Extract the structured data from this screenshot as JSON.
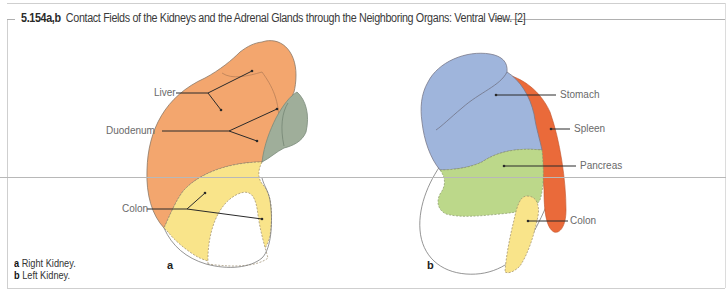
{
  "figure": {
    "number": "5.154a,b",
    "title": "Contact Fields of the Kidneys and the Adrenal Glands through the Neighboring Organs: Ventral View. [2]"
  },
  "panels": [
    {
      "letter": "a",
      "caption_letter": "a",
      "caption_text": "Right Kidney.",
      "labels": [
        "Liver",
        "Duodenum",
        "Colon"
      ]
    },
    {
      "letter": "b",
      "caption_letter": "b",
      "caption_text": "Left Kidney.",
      "labels": [
        "Stomach",
        "Spleen",
        "Pancreas",
        "Colon"
      ]
    }
  ],
  "colors": {
    "liver": "#f3a66e",
    "duodenum": "#9fae9a",
    "colon": "#f9e48a",
    "stomach": "#9fb5dc",
    "spleen": "#ea6a3a",
    "pancreas": "#bcd88a",
    "outline": "#7a7a7a",
    "leader": "#2a2a2a"
  }
}
